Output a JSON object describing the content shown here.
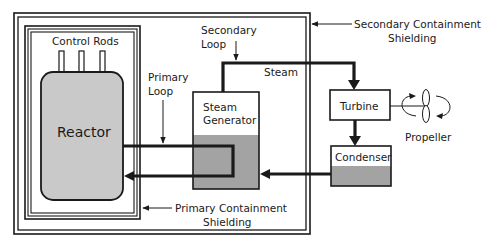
{
  "diagram": {
    "components": {
      "control_rods": "Control Rods",
      "reactor": "Reactor",
      "steam_generator_line1": "Steam",
      "steam_generator_line2": "Generator",
      "turbine": "Turbine",
      "condenser": "Condenser",
      "propeller": "Propeller"
    },
    "labels": {
      "primary_loop_line1": "Primary",
      "primary_loop_line2": "Loop",
      "secondary_loop_line1": "Secondary",
      "secondary_loop_line2": "Loop",
      "steam": "Steam",
      "secondary_containment_line1": "Secondary  Containment",
      "secondary_containment_line2": "Shielding",
      "primary_containment_line1": "Primary Containment",
      "primary_containment_line2": "Shielding"
    },
    "colors": {
      "reactor_fill": "#c9c9c9",
      "water_fill": "#a3a3a3",
      "line": "#1a1a1a",
      "background": "#ffffff"
    }
  }
}
